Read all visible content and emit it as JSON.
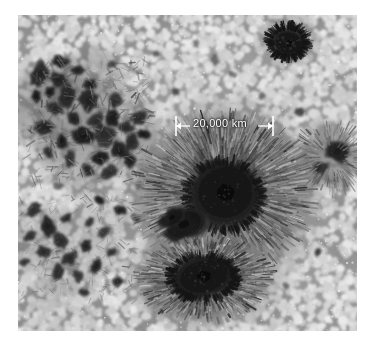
{
  "figure": {
    "kind": "solar-photosphere-photograph",
    "background_color": "#ffffff",
    "plate": {
      "x": 18,
      "y": 15,
      "width": 339,
      "height": 316,
      "base_color": "#b9b9b9"
    }
  },
  "annotation": {
    "scalebar": {
      "label": "20,000 km",
      "label_color": "#ffffff",
      "line_color": "#ffffff",
      "left_x": 176,
      "right_x": 273,
      "y": 126,
      "tick_half_height": 10,
      "arrow_size": 5,
      "gap_left": 190,
      "gap_right": 258
    }
  },
  "palette": {
    "granule_bright": "#e6e6e6",
    "granule_mid": "#c4c4c4",
    "lane_dark": "#7a7a7a",
    "penumbra_dark": "#3a3a3a",
    "penumbra_mid": "#6e6e6e",
    "penumbra_light": "#9a9a9a",
    "umbra": "#0a0a0a",
    "pore": "#141414"
  },
  "features": {
    "umbrae": [
      {
        "name": "main-sunspot-umbra",
        "cx": 224,
        "cy": 196,
        "rx": 37,
        "ry": 34,
        "rot": -15
      },
      {
        "name": "lower-sunspot-umbra",
        "cx": 203,
        "cy": 277,
        "rx": 32,
        "ry": 21,
        "rot": -12
      },
      {
        "name": "upper-right-pore",
        "cx": 288,
        "cy": 42,
        "rx": 17,
        "ry": 14,
        "rot": 10
      }
    ],
    "penumbrae": [
      {
        "name": "main-sunspot-penumbra",
        "cx": 224,
        "cy": 193,
        "rx": 92,
        "ry": 82,
        "rot": -8
      },
      {
        "name": "lower-sunspot-penumbra",
        "cx": 205,
        "cy": 278,
        "rx": 70,
        "ry": 45,
        "rot": -10
      }
    ],
    "pore_clusters": [
      {
        "name": "left-pore-cluster",
        "cx": 75,
        "cy": 115
      },
      {
        "name": "lower-left-pore-cluster",
        "cx": 62,
        "cy": 245
      },
      {
        "name": "right-edge-pore",
        "cx": 336,
        "cy": 156
      }
    ]
  }
}
